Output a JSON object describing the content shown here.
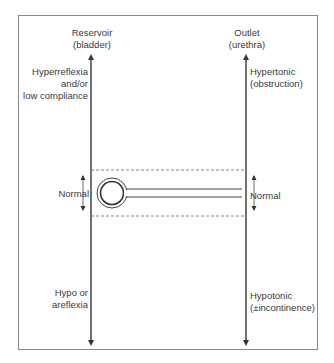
{
  "reservoir": {
    "title_line1": "Reservoir",
    "title_line2": "(bladder)",
    "top_line1": "Hyperreflexia",
    "top_line2": "and/or",
    "top_line3": "low compliance",
    "middle": "Normal",
    "bottom_line1": "Hypo or",
    "bottom_line2": "areflexia"
  },
  "outlet": {
    "title_line1": "Outlet",
    "title_line2": "(urethra)",
    "top_line1": "Hypertonic",
    "top_line2": "(obstruction)",
    "middle": "Normal",
    "bottom_line1": "Hypotonic",
    "bottom_line2": "(±incontinence)"
  },
  "colors": {
    "line": "#444444",
    "frame": "#8a8a8a",
    "dashed": "#666666"
  }
}
